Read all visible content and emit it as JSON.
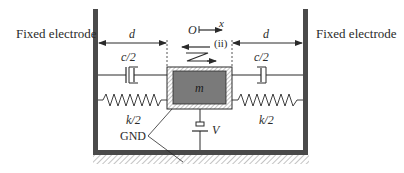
{
  "diagram": {
    "left_electrode_label": "Fixed electrode",
    "right_electrode_label": "Fixed electrode",
    "left_gap_label": "d",
    "right_gap_label": "d",
    "origin_label": "O",
    "axis_label": "x",
    "mode_label": "(ii)",
    "left_damper_label": "c/2",
    "right_damper_label": "c/2",
    "mass_label": "m",
    "left_spring_label": "k/2",
    "right_spring_label": "k/2",
    "ground_label": "GND",
    "voltage_label": "V"
  },
  "colors": {
    "wall": "#4a4a4a",
    "mass_fill": "#7a7a7a",
    "line": "#2a2a2a",
    "hatch": "#9a9a9a"
  }
}
